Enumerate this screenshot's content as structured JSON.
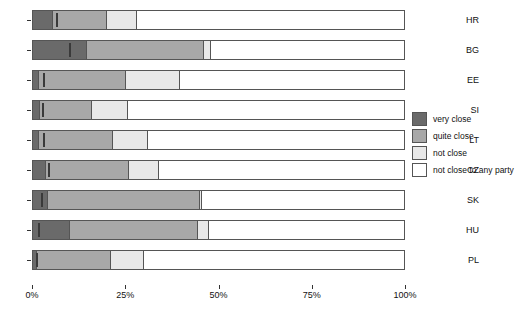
{
  "chart_data": {
    "type": "bar",
    "orientation": "horizontal",
    "stacked": true,
    "normalized": true,
    "title": "",
    "subtitle": "",
    "xlabel": "",
    "ylabel": "",
    "xlim": [
      0,
      100
    ],
    "xticks": [
      0,
      25,
      50,
      75,
      100
    ],
    "xtick_labels": [
      "0%",
      "25%",
      "50%",
      "75%",
      "100%"
    ],
    "grid": false,
    "legend_position": "right",
    "categories": [
      "HR",
      "BG",
      "EE",
      "SI",
      "LT",
      "CZ",
      "SK",
      "HU",
      "PL"
    ],
    "series": [
      {
        "name": "very close",
        "color": "#6a6a6a",
        "values": [
          5.5,
          14.5,
          1.5,
          2.0,
          1.5,
          3.5,
          4.0,
          10.0,
          1.0
        ]
      },
      {
        "name": "quite close",
        "color": "#a8a8a8",
        "values": [
          14.5,
          31.5,
          23.5,
          14.0,
          20.0,
          22.5,
          41.0,
          34.5,
          20.0
        ]
      },
      {
        "name": "not close",
        "color": "#e8e8e8",
        "values": [
          8.0,
          2.0,
          14.5,
          9.5,
          9.5,
          8.0,
          0.5,
          3.0,
          9.0
        ]
      },
      {
        "name": "not close to any party",
        "color": "#ffffff",
        "values": [
          72.0,
          52.0,
          60.5,
          74.5,
          69.0,
          66.0,
          54.5,
          52.5,
          70.0
        ]
      }
    ],
    "markers": {
      "name": "reference-tick",
      "color": "#3a3a3a",
      "values": [
        6.5,
        10.0,
        3.0,
        2.8,
        3.0,
        4.3,
        2.5,
        1.5,
        1.2
      ]
    }
  },
  "legend": {
    "items": [
      {
        "label": "very close",
        "swatch": "s0"
      },
      {
        "label": "quite close",
        "swatch": "s1"
      },
      {
        "label": "not close",
        "swatch": "s2"
      },
      {
        "label": "not close to any party",
        "swatch": "s3"
      }
    ]
  }
}
